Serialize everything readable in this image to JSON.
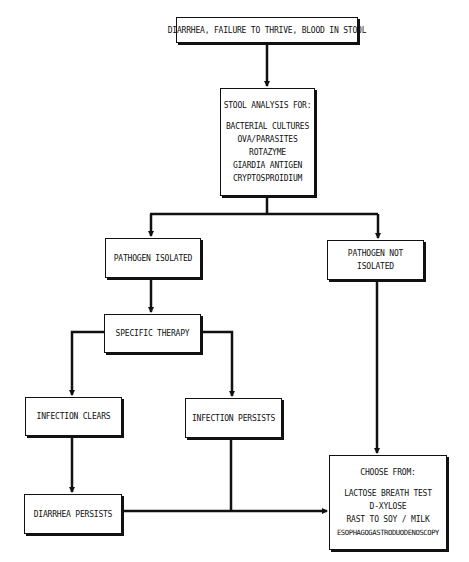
{
  "nodes": {
    "symptoms": {
      "label": "DIARRHEA, FAILURE TO THRIVE, BLOOD IN STOOL"
    },
    "stool_analysis": {
      "title": "STOOL ANALYSIS FOR:",
      "items": [
        "BACTERIAL CULTURES",
        "OVA/PARASITES",
        "ROTAZYME",
        "GIARDIA ANTIGEN",
        "CRYPTOSPROIDIUM"
      ]
    },
    "pathogen_isolated": {
      "label": "PATHOGEN ISOLATED"
    },
    "pathogen_not_isolated": {
      "line1": "PATHOGEN NOT",
      "line2": "ISOLATED"
    },
    "specific_therapy": {
      "label": "SPECIFIC THERAPY"
    },
    "infection_clears": {
      "label": "INFECTION CLEARS"
    },
    "infection_persists": {
      "label": "INFECTION PERSISTS"
    },
    "diarrhea_persists": {
      "label": "DIARRHEA PERSISTS"
    },
    "choose_from": {
      "title": "CHOOSE FROM:",
      "items": [
        "LACTOSE BREATH TEST",
        "D-XYLOSE",
        "RAST TO SOY / MILK",
        "ESOPHAGOGASTRODUODENOSCOPY"
      ]
    }
  },
  "edges": [
    {
      "from": "symptoms",
      "to": "stool_analysis"
    },
    {
      "from": "stool_analysis",
      "to": "pathogen_isolated"
    },
    {
      "from": "stool_analysis",
      "to": "pathogen_not_isolated"
    },
    {
      "from": "pathogen_isolated",
      "to": "specific_therapy"
    },
    {
      "from": "specific_therapy",
      "to": "infection_clears"
    },
    {
      "from": "specific_therapy",
      "to": "infection_persists"
    },
    {
      "from": "infection_clears",
      "to": "diarrhea_persists"
    },
    {
      "from": "infection_persists",
      "to": "choose_from"
    },
    {
      "from": "diarrhea_persists",
      "to": "choose_from"
    },
    {
      "from": "pathogen_not_isolated",
      "to": "choose_from"
    }
  ]
}
